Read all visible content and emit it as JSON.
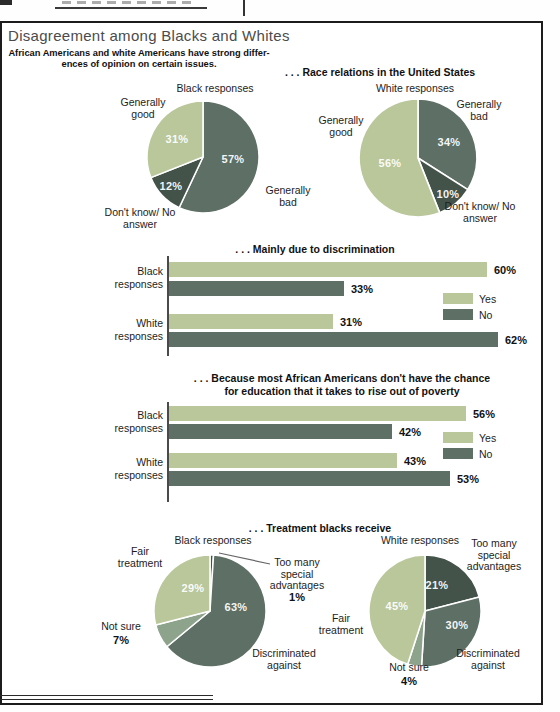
{
  "title": "Disagreement among Blacks and Whites",
  "subtitle": {
    "line1": "African Americans and white Americans have strong differ-",
    "line2": "ences of opinion on certain issues."
  },
  "colors": {
    "light": "#b9c79b",
    "medium": "#8ea38c",
    "dark": "#5e7066",
    "darkest": "#43534a",
    "text": "#1d1d1d",
    "title_gray": "#4b4b4b"
  },
  "chart_data": [
    {
      "type": "pie",
      "section": ". . . Race relations in the United States",
      "title": "Black responses",
      "slices": [
        {
          "label": "Generally bad",
          "value": 57,
          "color": "dark"
        },
        {
          "label": "Don't know/ No answer",
          "value": 12,
          "color": "darkest"
        },
        {
          "label": "Generally good",
          "value": 31,
          "color": "light"
        }
      ]
    },
    {
      "type": "pie",
      "title": "White responses",
      "slices": [
        {
          "label": "Generally bad",
          "value": 34,
          "color": "dark"
        },
        {
          "label": "Don't know/ No answer",
          "value": 10,
          "color": "darkest"
        },
        {
          "label": "Generally good",
          "value": 56,
          "color": "light"
        }
      ]
    },
    {
      "type": "bar",
      "title": ". . . Mainly due to discrimination",
      "categories": [
        "Black responses",
        "White responses"
      ],
      "series": [
        {
          "name": "Yes",
          "color": "light",
          "values": [
            60,
            31
          ]
        },
        {
          "name": "No",
          "color": "dark",
          "values": [
            33,
            62
          ]
        }
      ],
      "xlim": [
        0,
        65
      ],
      "unit": "%",
      "legend_position": "right"
    },
    {
      "type": "bar",
      "title_line1": ". . . Because most African Americans don't have the chance",
      "title_line2": "for education that it takes to rise out of poverty",
      "categories": [
        "Black responses",
        "White responses"
      ],
      "series": [
        {
          "name": "Yes",
          "color": "light",
          "values": [
            56,
            43
          ]
        },
        {
          "name": "No",
          "color": "dark",
          "values": [
            42,
            53
          ]
        }
      ],
      "xlim": [
        0,
        65
      ],
      "unit": "%",
      "legend_position": "right"
    },
    {
      "type": "pie",
      "section": ". . . Treatment blacks receive",
      "title": "Black responses",
      "slices": [
        {
          "label": "Too many special advantages",
          "value": 1,
          "color": "darkest"
        },
        {
          "label": "Discriminated against",
          "value": 63,
          "color": "dark"
        },
        {
          "label": "Not sure",
          "value": 7,
          "color": "medium"
        },
        {
          "label": "Fair treatment",
          "value": 29,
          "color": "light"
        }
      ]
    },
    {
      "type": "pie",
      "title": "White responses",
      "slices": [
        {
          "label": "Too many special advantages",
          "value": 21,
          "color": "darkest"
        },
        {
          "label": "Discriminated against",
          "value": 30,
          "color": "dark"
        },
        {
          "label": "Not sure",
          "value": 4,
          "color": "medium"
        },
        {
          "label": "Fair treatment",
          "value": 45,
          "color": "light"
        }
      ]
    }
  ]
}
